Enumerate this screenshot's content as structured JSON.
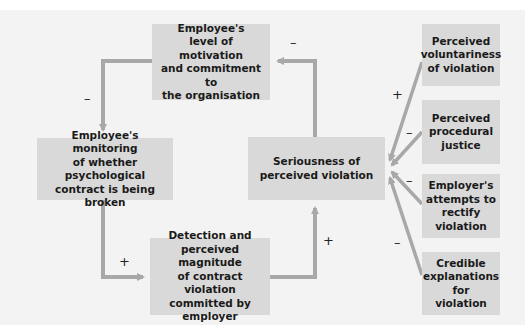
{
  "diagram": {
    "colors": {
      "background": "#f3f3f3",
      "box": "#d9d9d9",
      "arrow": "#a8a8a8",
      "text": "#1a1a1a"
    },
    "nodes": {
      "motivation": {
        "lines": [
          "Employee's",
          "level of motivation",
          "and commitment to",
          "the organisation"
        ]
      },
      "monitoring": {
        "lines": [
          "Employee's monitoring",
          "of whether psychological",
          "contract is being broken"
        ]
      },
      "detection": {
        "lines": [
          "Detection and",
          "perceived magnitude",
          "of contract violation",
          "committed by",
          "employer"
        ]
      },
      "seriousness": {
        "lines": [
          "Seriousness of",
          "perceived violation"
        ]
      },
      "voluntariness": {
        "lines": [
          "Perceived",
          "voluntariness",
          "of violation"
        ]
      },
      "procedural": {
        "lines": [
          "Perceived",
          "procedural",
          "justice"
        ]
      },
      "rectify": {
        "lines": [
          "Employer's",
          "attempts to",
          "rectify",
          "violation"
        ]
      },
      "explanations": {
        "lines": [
          "Credible",
          "explanations",
          "for",
          "violation"
        ]
      }
    },
    "signs": {
      "motivation_to_monitoring": "–",
      "seriousness_to_motivation": "–",
      "monitoring_to_detection": "+",
      "detection_to_seriousness": "+",
      "voluntariness_to_seriousness": "+",
      "procedural_to_seriousness": "–",
      "rectify_to_seriousness": "–",
      "explanations_to_seriousness": "–"
    }
  }
}
